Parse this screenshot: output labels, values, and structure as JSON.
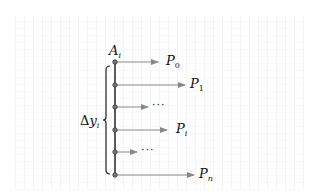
{
  "diagram": {
    "top_node_label": {
      "base": "A",
      "sub": "i"
    },
    "brace_label": {
      "prefix": "Δ",
      "var": "y",
      "sub": "i"
    },
    "colors": {
      "axis": "#333333",
      "arrow": "#888888",
      "node": "#777777",
      "text": "#111111"
    },
    "rows": [
      {
        "y": 62,
        "arrow_end": 158,
        "label": {
          "base": "P",
          "sub": "0",
          "x": 166
        }
      },
      {
        "y": 85,
        "arrow_end": 185,
        "label": {
          "base": "P",
          "sub": "1",
          "x": 190
        }
      },
      {
        "y": 107,
        "arrow_end": 148,
        "label": {
          "ellipsis": "···",
          "x": 152
        }
      },
      {
        "y": 130,
        "arrow_end": 167,
        "label": {
          "base": "P",
          "sub": "i",
          "x": 176
        }
      },
      {
        "y": 152,
        "arrow_end": 137,
        "label": {
          "ellipsis": "···",
          "x": 141
        }
      },
      {
        "y": 175,
        "arrow_end": 194,
        "label": {
          "base": "P",
          "sub": "n",
          "x": 199
        }
      }
    ]
  }
}
